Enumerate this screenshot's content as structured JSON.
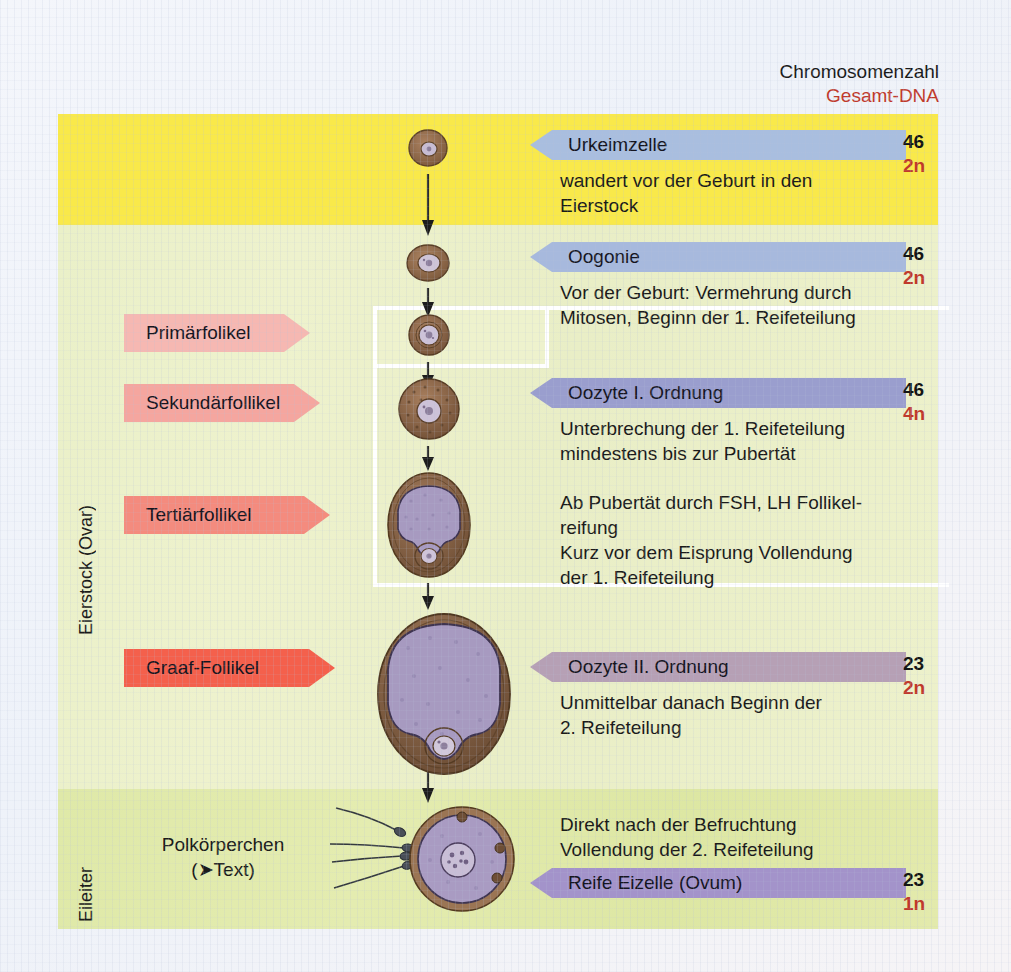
{
  "heading": {
    "line1": "Chromosomenzahl",
    "line2": "Gesamt-DNA"
  },
  "sections": [
    {
      "id": "ovary",
      "label": "Eierstock (Ovar)"
    },
    {
      "id": "oviduct",
      "label": "Eileiter"
    }
  ],
  "stages": [
    {
      "id": "urkeimzelle",
      "callout": "Urkeimzelle",
      "callout_color": "#a9bedf",
      "description": "wandert vor der Geburt in den\nEierstock",
      "chromosomes": "46",
      "dna": "2n"
    },
    {
      "id": "oogonie",
      "callout": "Oogonie",
      "callout_color": "#a7b9dd",
      "description": "Vor der Geburt: Vermehrung durch\nMitosen, Beginn der 1. Reifeteilung",
      "chromosomes": "46",
      "dna": "2n"
    },
    {
      "id": "oozyte-1",
      "callout": "Oozyte I. Ordnung",
      "callout_color": "#9a9ece",
      "description": "Unterbrechung der 1. Reifeteilung\nmindestens bis zur Pubertät",
      "description2": "Ab Pubertät durch FSH, LH Follikel-\nreifung\nKurz vor dem Eisprung Vollendung\nder 1. Reifeteilung",
      "chromosomes": "46",
      "dna": "4n"
    },
    {
      "id": "oozyte-2",
      "callout": "Oozyte II. Ordnung",
      "callout_color": "#b6a0b5",
      "description": "Unmittelbar danach Beginn der\n2. Reifeteilung",
      "chromosomes": "23",
      "dna": "2n"
    },
    {
      "id": "ovum",
      "callout": "Reife Eizelle (Ovum)",
      "callout_color": "#a393ca",
      "description": "Direkt nach der Befruchtung\nVollendung der 2. Reifeteilung",
      "chromosomes": "23",
      "dna": "1n"
    }
  ],
  "follicles": [
    {
      "id": "primaer",
      "label": "Primärfolikel",
      "color": "#f6b8b2"
    },
    {
      "id": "sekundaer",
      "label": "Sekundärfollikel",
      "color": "#f5a69f"
    },
    {
      "id": "tertiaer",
      "label": "Tertiärfollikel",
      "color": "#f48b7e"
    },
    {
      "id": "graaf",
      "label": "Graaf-Follikel",
      "color": "#f4604c"
    }
  ],
  "polar_body": {
    "line1": "Polkörperchen",
    "line2": "(➤Text)"
  },
  "colors": {
    "band_yellow": "#f9e94a",
    "band_ovary": "#eaf0c8",
    "band_tube": "#dfe9a8",
    "cytoplasm": "#9a7250",
    "cytoplasm_dark": "#6e4f35",
    "nucleus": "#b9a8c9",
    "antrum": "#a396bd",
    "dna_red": "#c0392b"
  }
}
